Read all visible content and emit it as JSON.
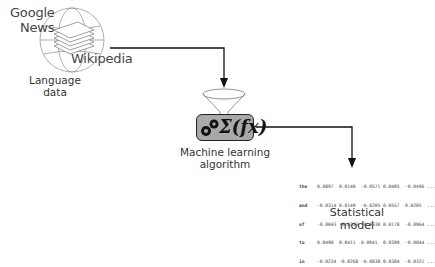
{
  "sources": {
    "labels": [
      "Google",
      "News",
      "Wikipedia"
    ],
    "caption": "Language data"
  },
  "algorithm": {
    "formula": "Σ(fx)",
    "caption_line1": "Machine learning",
    "caption_line2": "algorithm"
  },
  "model": {
    "caption": "Statistical model",
    "rows": [
      {
        "word": "the",
        "values": [
          "0.0897",
          "0.0140",
          "-0.0571",
          "0.0405",
          "-0.0496"
        ],
        "more": "..."
      },
      {
        "word": "and",
        "values": [
          "-0.0314",
          "0.0149",
          "-0.0205",
          "0.0557",
          "0.0205"
        ],
        "more": "..."
      },
      {
        "word": "of",
        "values": [
          "-0.0043",
          "-0.0253",
          "-0.0338",
          "0.0178",
          "-0.0964"
        ],
        "more": "..."
      },
      {
        "word": "to",
        "values": [
          "0.0490",
          "0.0411",
          "0.0041",
          "0.0309",
          "-0.0044"
        ],
        "more": "..."
      },
      {
        "word": "in",
        "values": [
          "-0.0234",
          "-0.0268",
          "-0.0838",
          "0.0384",
          "-0.0321"
        ],
        "more": "..."
      }
    ]
  },
  "colors": {
    "line": "#111111",
    "box_fill": "#a9a9a9",
    "globe": "#9a9a9a"
  }
}
